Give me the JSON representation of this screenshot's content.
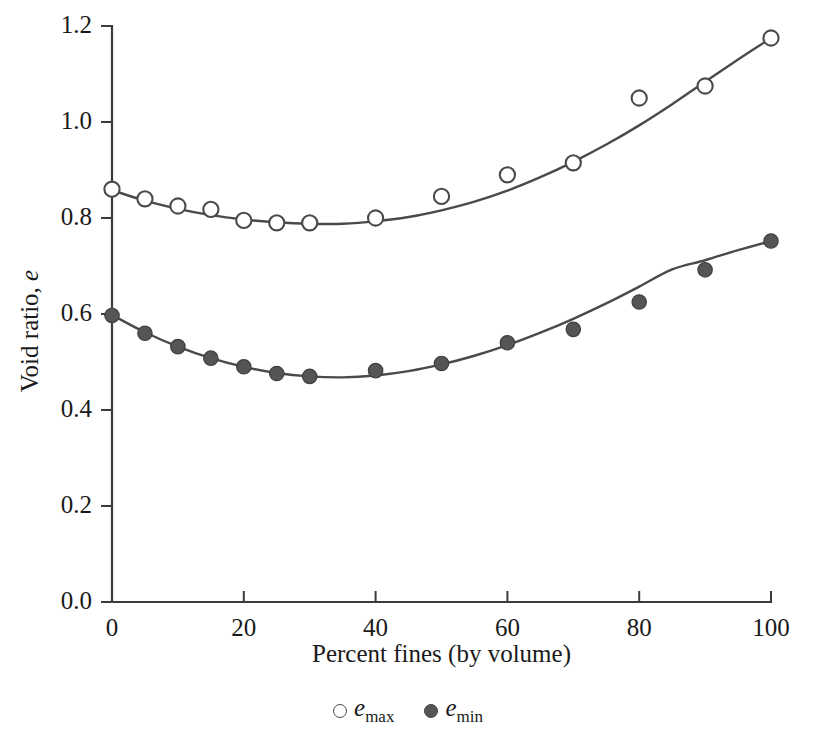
{
  "chart_data": {
    "type": "scatter",
    "title": "",
    "xlabel": "Percent fines (by volume)",
    "ylabel": "Void ratio, e",
    "ylabel_symbol": "e",
    "ylabel_prefix": "Void ratio, ",
    "xlim": [
      0,
      100
    ],
    "ylim": [
      0.0,
      1.2
    ],
    "xticks": [
      0,
      20,
      40,
      60,
      80,
      100
    ],
    "xtick_labels": [
      "0",
      "20",
      "40",
      "60",
      "80",
      "100"
    ],
    "yticks": [
      0.0,
      0.2,
      0.4,
      0.6,
      0.8,
      1.0,
      1.2
    ],
    "ytick_labels": [
      "0.0",
      "0.2",
      "0.4",
      "0.6",
      "0.8",
      "1.0",
      "1.2"
    ],
    "grid": false,
    "legend_position": "below-axis-center",
    "series": [
      {
        "name": "e_max",
        "label_symbol": "e",
        "label_subscript": "max",
        "marker": "open-circle",
        "color": "#4a4a4a",
        "fill": "#ffffff",
        "x": [
          0,
          5,
          10,
          15,
          20,
          25,
          30,
          40,
          50,
          60,
          70,
          80,
          90,
          100
        ],
        "y": [
          0.86,
          0.84,
          0.825,
          0.818,
          0.795,
          0.79,
          0.79,
          0.8,
          0.845,
          0.89,
          0.915,
          1.05,
          1.075,
          1.175
        ],
        "fit_curve": [
          [
            0,
            0.858
          ],
          [
            5,
            0.836
          ],
          [
            10,
            0.819
          ],
          [
            15,
            0.806
          ],
          [
            20,
            0.797
          ],
          [
            25,
            0.791
          ],
          [
            30,
            0.788
          ],
          [
            35,
            0.788
          ],
          [
            40,
            0.793
          ],
          [
            45,
            0.802
          ],
          [
            50,
            0.816
          ],
          [
            55,
            0.834
          ],
          [
            60,
            0.857
          ],
          [
            65,
            0.885
          ],
          [
            70,
            0.917
          ],
          [
            75,
            0.953
          ],
          [
            80,
            0.993
          ],
          [
            85,
            1.037
          ],
          [
            90,
            1.084
          ],
          [
            95,
            1.13
          ],
          [
            100,
            1.175
          ]
        ]
      },
      {
        "name": "e_min",
        "label_symbol": "e",
        "label_subscript": "min",
        "marker": "filled-circle",
        "color": "#555555",
        "fill": "#555555",
        "x": [
          0,
          5,
          10,
          15,
          20,
          25,
          30,
          40,
          50,
          60,
          70,
          80,
          90,
          100
        ],
        "y": [
          0.597,
          0.56,
          0.532,
          0.508,
          0.49,
          0.476,
          0.47,
          0.482,
          0.497,
          0.54,
          0.568,
          0.625,
          0.692,
          0.752
        ],
        "fit_curve": [
          [
            0,
            0.598
          ],
          [
            5,
            0.562
          ],
          [
            10,
            0.532
          ],
          [
            15,
            0.508
          ],
          [
            20,
            0.49
          ],
          [
            25,
            0.477
          ],
          [
            30,
            0.47
          ],
          [
            35,
            0.468
          ],
          [
            40,
            0.472
          ],
          [
            45,
            0.481
          ],
          [
            50,
            0.495
          ],
          [
            55,
            0.513
          ],
          [
            60,
            0.535
          ],
          [
            65,
            0.561
          ],
          [
            70,
            0.59
          ],
          [
            75,
            0.622
          ],
          [
            80,
            0.657
          ],
          [
            85,
            0.693
          ],
          [
            90,
            0.712
          ],
          [
            95,
            0.733
          ],
          [
            100,
            0.752
          ]
        ]
      }
    ]
  },
  "legend": {
    "entries": [
      {
        "marker": "open-circle",
        "symbol": "e",
        "subscript": "max"
      },
      {
        "marker": "filled-circle",
        "symbol": "e",
        "subscript": "min"
      }
    ]
  }
}
